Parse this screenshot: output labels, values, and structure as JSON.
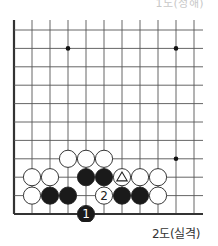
{
  "diagram": {
    "top_caption": "1도(정해)",
    "caption": "2도(실격)",
    "board": {
      "columns": 11,
      "rows": 11,
      "origin_x": 14,
      "origin_y": 30,
      "col_spacing": 18,
      "row_spacing": 18.4,
      "stone_radius": 8.6,
      "left_edge_thick": true,
      "bottom_edge_thick": true,
      "star_points": [
        [
          3,
          1
        ],
        [
          9,
          1
        ],
        [
          9,
          7
        ]
      ],
      "colors": {
        "line": "#555555",
        "black": "#1a1a1a",
        "white": "#ffffff",
        "edge": "#333333"
      }
    },
    "stones": [
      {
        "col": 3,
        "row": 7,
        "color": "white"
      },
      {
        "col": 4,
        "row": 7,
        "color": "white"
      },
      {
        "col": 5,
        "row": 7,
        "color": "white"
      },
      {
        "col": 1,
        "row": 8,
        "color": "white"
      },
      {
        "col": 2,
        "row": 8,
        "color": "white"
      },
      {
        "col": 4,
        "row": 8,
        "color": "black"
      },
      {
        "col": 5,
        "row": 8,
        "color": "black"
      },
      {
        "col": 6,
        "row": 8,
        "color": "white",
        "mark": "triangle"
      },
      {
        "col": 7,
        "row": 8,
        "color": "white"
      },
      {
        "col": 8,
        "row": 8,
        "color": "white"
      },
      {
        "col": 1,
        "row": 9,
        "color": "white"
      },
      {
        "col": 2,
        "row": 9,
        "color": "black"
      },
      {
        "col": 3,
        "row": 9,
        "color": "black"
      },
      {
        "col": 5,
        "row": 9,
        "color": "white",
        "label": "2"
      },
      {
        "col": 6,
        "row": 9,
        "color": "black"
      },
      {
        "col": 7,
        "row": 9,
        "color": "black"
      },
      {
        "col": 8,
        "row": 9,
        "color": "white"
      },
      {
        "col": 4,
        "row": 10,
        "color": "black",
        "label": "1"
      }
    ]
  }
}
